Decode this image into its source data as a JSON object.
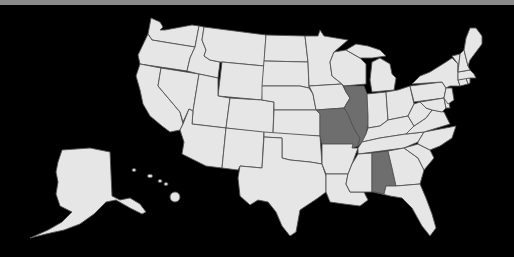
{
  "map": {
    "title": "United States map with highlighted states",
    "colors": {
      "background": "#000000",
      "top_bar": "#8a8a8a",
      "state_fill": "#e6e6e6",
      "highlight_fill": "#6e6e6e",
      "border": "#555555"
    },
    "highlighted_states": [
      "Missouri",
      "Illinois",
      "Alabama"
    ],
    "states": [
      {
        "name": "Washington",
        "highlighted": false
      },
      {
        "name": "Oregon",
        "highlighted": false
      },
      {
        "name": "California",
        "highlighted": false
      },
      {
        "name": "Nevada",
        "highlighted": false
      },
      {
        "name": "Idaho",
        "highlighted": false
      },
      {
        "name": "Montana",
        "highlighted": false
      },
      {
        "name": "Wyoming",
        "highlighted": false
      },
      {
        "name": "Utah",
        "highlighted": false
      },
      {
        "name": "Arizona",
        "highlighted": false
      },
      {
        "name": "Colorado",
        "highlighted": false
      },
      {
        "name": "New Mexico",
        "highlighted": false
      },
      {
        "name": "North Dakota",
        "highlighted": false
      },
      {
        "name": "South Dakota",
        "highlighted": false
      },
      {
        "name": "Nebraska",
        "highlighted": false
      },
      {
        "name": "Kansas",
        "highlighted": false
      },
      {
        "name": "Oklahoma",
        "highlighted": false
      },
      {
        "name": "Texas",
        "highlighted": false
      },
      {
        "name": "Minnesota",
        "highlighted": false
      },
      {
        "name": "Iowa",
        "highlighted": false
      },
      {
        "name": "Missouri",
        "highlighted": true
      },
      {
        "name": "Arkansas",
        "highlighted": false
      },
      {
        "name": "Louisiana",
        "highlighted": false
      },
      {
        "name": "Wisconsin",
        "highlighted": false
      },
      {
        "name": "Illinois",
        "highlighted": true
      },
      {
        "name": "Michigan",
        "highlighted": false
      },
      {
        "name": "Indiana",
        "highlighted": false
      },
      {
        "name": "Ohio",
        "highlighted": false
      },
      {
        "name": "Kentucky",
        "highlighted": false
      },
      {
        "name": "Tennessee",
        "highlighted": false
      },
      {
        "name": "Mississippi",
        "highlighted": false
      },
      {
        "name": "Alabama",
        "highlighted": true
      },
      {
        "name": "Georgia",
        "highlighted": false
      },
      {
        "name": "Florida",
        "highlighted": false
      },
      {
        "name": "South Carolina",
        "highlighted": false
      },
      {
        "name": "North Carolina",
        "highlighted": false
      },
      {
        "name": "Virginia",
        "highlighted": false
      },
      {
        "name": "West Virginia",
        "highlighted": false
      },
      {
        "name": "Pennsylvania",
        "highlighted": false
      },
      {
        "name": "New York",
        "highlighted": false
      },
      {
        "name": "Maryland",
        "highlighted": false
      },
      {
        "name": "Delaware",
        "highlighted": false
      },
      {
        "name": "New Jersey",
        "highlighted": false
      },
      {
        "name": "Connecticut",
        "highlighted": false
      },
      {
        "name": "Rhode Island",
        "highlighted": false
      },
      {
        "name": "Massachusetts",
        "highlighted": false
      },
      {
        "name": "Vermont",
        "highlighted": false
      },
      {
        "name": "New Hampshire",
        "highlighted": false
      },
      {
        "name": "Maine",
        "highlighted": false
      },
      {
        "name": "Alaska",
        "highlighted": false
      },
      {
        "name": "Hawaii",
        "highlighted": false
      }
    ]
  }
}
